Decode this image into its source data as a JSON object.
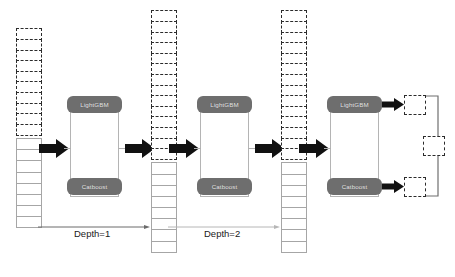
{
  "diagram": {
    "models": {
      "lightgbm_label": "LightGBM",
      "catboost_label": "Catboost"
    },
    "depth_labels": [
      {
        "text": "Depth=1"
      },
      {
        "text": "Depth=2"
      }
    ],
    "columns": [
      {
        "name": "input-feature-column",
        "dashed_cells": 10,
        "solid_cells": 8
      },
      {
        "name": "augmented-feature-column-1",
        "dashed_cells": 14,
        "solid_cells": 8
      },
      {
        "name": "augmented-feature-column-2",
        "dashed_cells": 14,
        "solid_cells": 8
      }
    ],
    "outputs": {
      "lightgbm_output": "",
      "catboost_output": "",
      "final_output": ""
    },
    "colors": {
      "model_fill": "#6e6e6e",
      "model_text": "#e9e9e9",
      "arrow": "#111111",
      "dashed_stroke": "#2b2b2b",
      "solid_stroke": "#a6a6a6",
      "box_stroke": "#b4b4b4",
      "background": "#ffffff"
    }
  }
}
